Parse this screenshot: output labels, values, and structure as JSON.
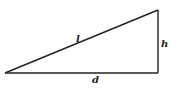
{
  "diagram": {
    "type": "right-triangle",
    "labels": {
      "hypotenuse": "l",
      "height": "h",
      "base": "d"
    },
    "vertices": {
      "left": [
        5,
        73
      ],
      "top_right": [
        158,
        10
      ],
      "bottom_right": [
        158,
        73
      ]
    },
    "stroke_color": "#222222"
  }
}
